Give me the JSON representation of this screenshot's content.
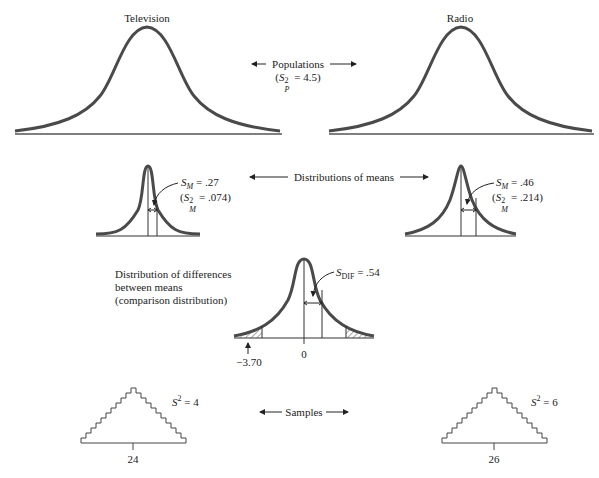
{
  "populations": {
    "left_title": "Television",
    "right_title": "Radio",
    "label": "Populations",
    "variance_symbol": "S",
    "variance_sub": "P",
    "variance_sup": "2",
    "variance_value": "= 4.5"
  },
  "distributions_of_means": {
    "label": "Distributions of means",
    "left": {
      "sm_symbol": "S",
      "sm_sub": "M",
      "sm_value": "= .27",
      "var_sub": "M",
      "var_sup": "2",
      "var_value": "= .074"
    },
    "right": {
      "sm_symbol": "S",
      "sm_sub": "M",
      "sm_value": "= .46",
      "var_sub": "M",
      "var_sup": "2",
      "var_value": "= .214"
    }
  },
  "comparison": {
    "label_line1": "Distribution of differences",
    "label_line2": "between means",
    "label_line3": "(comparison distribution)",
    "sdif_symbol": "S",
    "sdif_sub": "DIF",
    "sdif_value": "= .54",
    "zero_label": "0",
    "t_label": "−3.70"
  },
  "samples": {
    "label": "Samples",
    "left": {
      "variance_symbol": "S",
      "variance_sup": "2",
      "variance_value": "= 4",
      "mean": "24"
    },
    "right": {
      "variance_symbol": "S",
      "variance_sup": "2",
      "variance_value": "= 6",
      "mean": "26"
    }
  },
  "colors": {
    "curve": "#4a4a4a",
    "line": "#333333",
    "text": "#222222"
  }
}
